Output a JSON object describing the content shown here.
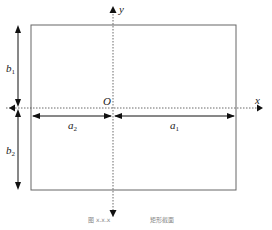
{
  "figure": {
    "axes": {
      "x_label": "x",
      "y_label": "y",
      "origin_label": "O"
    },
    "dimensions": [
      {
        "name": "a",
        "sub": "1"
      },
      {
        "name": "a",
        "sub": "2"
      },
      {
        "name": "b",
        "sub": "1"
      },
      {
        "name": "b",
        "sub": "2"
      }
    ],
    "caption_left": "图 x.x.x",
    "caption_right": "矩形截面"
  },
  "colors": {
    "stroke": "#555555",
    "axis": "#444444",
    "arrow": "#111111"
  }
}
